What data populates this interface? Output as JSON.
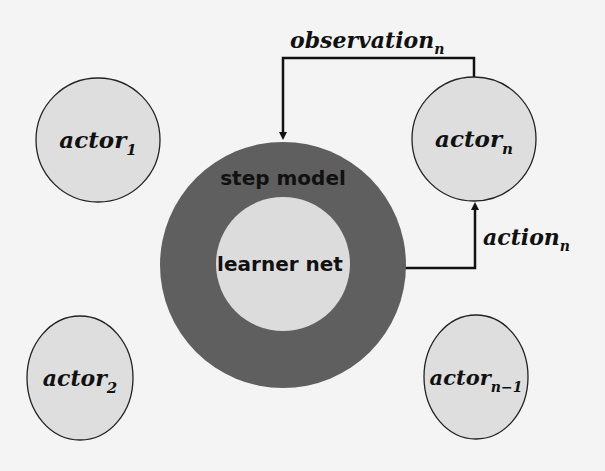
{
  "diagram": {
    "center": {
      "outer_label": "step model",
      "inner_label": "learner net",
      "ring_color": "#5f5f5f",
      "inner_color": "#dcdcdc"
    },
    "actors": [
      {
        "base": "actor",
        "sub": "1"
      },
      {
        "base": "actor",
        "sub": "n"
      },
      {
        "base": "actor",
        "sub": "2"
      },
      {
        "base": "actor",
        "sub": "n−1"
      }
    ],
    "edges": {
      "observation": {
        "base": "observation",
        "sub": "n"
      },
      "action": {
        "base": "action",
        "sub": "n"
      }
    },
    "colors": {
      "actor_fill": "#dedede",
      "line": "#111111",
      "background": "#f4f4f4"
    }
  }
}
